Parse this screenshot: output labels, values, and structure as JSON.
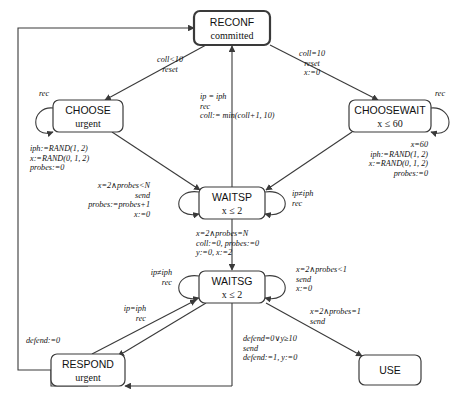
{
  "diagram": {
    "colors": {
      "stroke": "#3a3a3a",
      "text": "#111111",
      "background": "#ffffff"
    },
    "nodes": [
      {
        "id": "reconf",
        "label": "RECONF",
        "sub": "committed",
        "x": 232,
        "y": 28,
        "w": 76,
        "h": 34,
        "committed": true
      },
      {
        "id": "choose",
        "label": "CHOOSE",
        "sub": "urgent",
        "x": 88,
        "y": 116,
        "w": 70,
        "h": 32,
        "committed": false
      },
      {
        "id": "choosewait",
        "label": "CHOOSEWAIT",
        "sub": "x ≤ 60",
        "x": 390,
        "y": 116,
        "w": 82,
        "h": 32,
        "committed": false
      },
      {
        "id": "waitsp",
        "label": "WAITSP",
        "sub": "x ≤ 2",
        "x": 232,
        "y": 203,
        "w": 66,
        "h": 32,
        "committed": false
      },
      {
        "id": "waitsg",
        "label": "WAITSG",
        "sub": "x ≤ 2",
        "x": 232,
        "y": 287,
        "w": 66,
        "h": 32,
        "committed": false
      },
      {
        "id": "respond",
        "label": "RESPOND",
        "sub": "urgent",
        "x": 88,
        "y": 370,
        "w": 74,
        "h": 32,
        "committed": false
      },
      {
        "id": "use",
        "label": "USE",
        "sub": "",
        "x": 390,
        "y": 370,
        "w": 62,
        "h": 30,
        "committed": false
      }
    ],
    "edge_labels": [
      {
        "id": "reconf-to-choose",
        "lines": [
          "coll<10",
          "reset"
        ],
        "x": 170,
        "y": 62,
        "align": "middle",
        "italic": true
      },
      {
        "id": "reconf-to-choosewait",
        "lines": [
          "coll=10",
          "reset",
          "x:=0"
        ],
        "x": 312,
        "y": 56,
        "align": "middle",
        "italic": true
      },
      {
        "id": "waitsp-to-reconf",
        "lines": [
          "ip = iph",
          "rec",
          "coll:= min(coll+1, 10)"
        ],
        "x": 200,
        "y": 99,
        "align": "start",
        "italic": true
      },
      {
        "id": "choose-to-waitsp",
        "lines": [
          "iph:=RAND(1, 2)",
          "x:=RAND(0, 1, 2)",
          "probes:=0"
        ],
        "x": 30,
        "y": 151,
        "align": "start",
        "italic": true
      },
      {
        "id": "choosewait-to-waitsp",
        "lines": [
          "x=60",
          "iph:=RAND(1, 2)",
          "x:=RAND(0, 1, 2)",
          "probes:=0"
        ],
        "x": 428,
        "y": 147,
        "align": "end",
        "italic": true
      },
      {
        "id": "waitsp-self",
        "lines": [
          "x=2∧probes<N",
          "send",
          "probes:=probes+1",
          "x:=0"
        ],
        "x": 150,
        "y": 188,
        "align": "end",
        "italic": true
      },
      {
        "id": "waitsp-self-right",
        "lines": [
          "ip≠iph",
          "rec"
        ],
        "x": 292,
        "y": 196,
        "align": "start",
        "italic": true
      },
      {
        "id": "waitsp-to-waitsg",
        "lines": [
          "x=2∧probes=N",
          "coll:=0, probes:=0",
          "y:=0, x:=2"
        ],
        "x": 196,
        "y": 236,
        "align": "start",
        "italic": true
      },
      {
        "id": "waitsg-self-left",
        "lines": [
          "ip≠iph",
          "rec"
        ],
        "x": 172,
        "y": 275,
        "align": "end",
        "italic": true
      },
      {
        "id": "waitsg-self-right",
        "lines": [
          "x=2∧probes<1",
          "send",
          "x:=0"
        ],
        "x": 296,
        "y": 272,
        "align": "start",
        "italic": true
      },
      {
        "id": "respond-to-waitsg",
        "lines": [
          "ip=iph",
          "rec"
        ],
        "x": 146,
        "y": 311,
        "align": "end",
        "italic": true
      },
      {
        "id": "waitsg-to-respond",
        "lines": [
          "defend=0∨y≥10",
          "send",
          "defend:=1, y:=0"
        ],
        "x": 243,
        "y": 341,
        "align": "start",
        "italic": true
      },
      {
        "id": "waitsg-to-use",
        "lines": [
          "x=2∧probes=1",
          "send"
        ],
        "x": 310,
        "y": 314,
        "align": "start",
        "italic": true
      },
      {
        "id": "respond-to-reconf",
        "lines": [
          "defend:=0"
        ],
        "x": 26,
        "y": 343,
        "align": "start",
        "italic": true
      },
      {
        "id": "choose-self",
        "lines": [
          "rec"
        ],
        "x": 44,
        "y": 96,
        "align": "middle",
        "italic": true
      },
      {
        "id": "choosewait-self",
        "lines": [
          "rec"
        ],
        "x": 440,
        "y": 96,
        "align": "middle",
        "italic": true
      }
    ]
  }
}
